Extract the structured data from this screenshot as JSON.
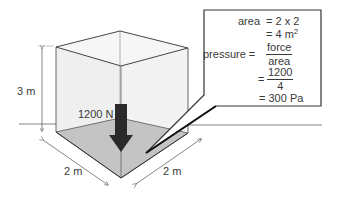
{
  "diagram": {
    "type": "pressure-calculation-box",
    "labels": {
      "height": "3 m",
      "width_left": "2 m",
      "width_right": "2 m",
      "force": "1200 N"
    },
    "callout": {
      "line1_lhs": "area",
      "line1_rhs": "= 2 x 2",
      "line2": "= 4 m",
      "line2_sup": "2",
      "line3_lhs": "pressure =",
      "line3_num": "force",
      "line3_den": "area",
      "line4_eq": "=",
      "line4_num": "1200",
      "line4_den": "4",
      "line5": "= 300 Pa"
    },
    "colors": {
      "box_face": "#efefef",
      "base_face": "#c4c4c4",
      "edge": "#444444",
      "arrow": "#2a2a2a",
      "text": "#3a3a3a"
    }
  }
}
